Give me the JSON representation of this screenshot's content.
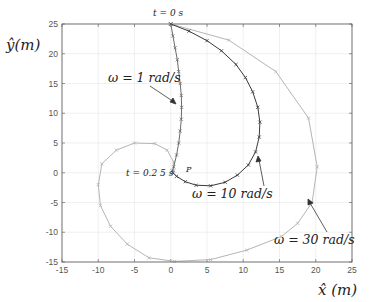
{
  "chart_data": {
    "type": "line",
    "title": "",
    "xlabel": "x̂ (m)",
    "ylabel": "ŷ(m)",
    "xlim": [
      -15,
      25
    ],
    "ylim": [
      -15,
      25
    ],
    "xticks": [
      -15,
      -10,
      -5,
      0,
      5,
      10,
      15,
      20,
      25
    ],
    "yticks": [
      -15,
      -10,
      -5,
      0,
      5,
      10,
      15,
      20,
      25
    ],
    "grid": true,
    "legend": null,
    "series": [
      {
        "name": "ω = 1 rad/s",
        "color": "#6b6b6b",
        "marker": "x",
        "points": [
          [
            0,
            25
          ],
          [
            0.3,
            23
          ],
          [
            0.6,
            21
          ],
          [
            0.9,
            19
          ],
          [
            1.1,
            17
          ],
          [
            1.3,
            15
          ],
          [
            1.45,
            13
          ],
          [
            1.5,
            11
          ],
          [
            1.45,
            9
          ],
          [
            1.3,
            7
          ],
          [
            1.1,
            5
          ],
          [
            0.8,
            3
          ],
          [
            0.4,
            1
          ],
          [
            0.2,
            0.3
          ]
        ]
      },
      {
        "name": "ω = 10 rad/s",
        "color": "#3a3a3a",
        "marker": "x",
        "points": [
          [
            0,
            25
          ],
          [
            2.5,
            23.8
          ],
          [
            5,
            22.2
          ],
          [
            7,
            20.5
          ],
          [
            9,
            18.2
          ],
          [
            10.3,
            16
          ],
          [
            11.3,
            13.6
          ],
          [
            12,
            11
          ],
          [
            12.3,
            8.5
          ],
          [
            12.2,
            6
          ],
          [
            11.7,
            3.5
          ],
          [
            10.7,
            1.3
          ],
          [
            9.2,
            -0.4
          ],
          [
            7.5,
            -1.6
          ],
          [
            5.5,
            -2.2
          ],
          [
            3.5,
            -2.1
          ],
          [
            2,
            -1.5
          ],
          [
            0.8,
            -0.6
          ],
          [
            0.3,
            0
          ]
        ]
      },
      {
        "name": "ω = 30 rad/s",
        "color": "#b5b5b5",
        "marker": "x",
        "points": [
          [
            0,
            25
          ],
          [
            8,
            22.3
          ],
          [
            14.5,
            17
          ],
          [
            19,
            9.2
          ],
          [
            20.2,
            1
          ],
          [
            19.5,
            -5
          ],
          [
            17.5,
            -8.5
          ],
          [
            15.3,
            -10.7
          ],
          [
            10.5,
            -13
          ],
          [
            5.5,
            -14.6
          ],
          [
            0.5,
            -14.9
          ],
          [
            -3,
            -14.3
          ],
          [
            -6,
            -12
          ],
          [
            -8.3,
            -9
          ],
          [
            -9.7,
            -5.5
          ],
          [
            -10,
            -2
          ],
          [
            -9.5,
            1.5
          ],
          [
            -7.5,
            3.8
          ],
          [
            -5,
            5
          ],
          [
            -2.2,
            4.9
          ],
          [
            -0.5,
            3.8
          ],
          [
            0.4,
            1.8
          ],
          [
            0.4,
            0.3
          ]
        ]
      }
    ],
    "annotations": [
      {
        "text": "t = 0 s",
        "x": 0,
        "y": 25
      },
      {
        "text": "t = 0.2 5 s",
        "x": 0,
        "y": 0
      },
      {
        "text": "P",
        "x": 2.3,
        "y": 0.5
      },
      {
        "text": "ω = 1 rad/s",
        "arrow_to": [
          1.3,
          12.5
        ]
      },
      {
        "text": "ω = 10 rad/s",
        "arrow_to": [
          12,
          4
        ]
      },
      {
        "text": "ω = 30 rad/s",
        "arrow_to": [
          18.7,
          -4.3
        ]
      }
    ]
  },
  "labels": {
    "ylabel": "ŷ(m)",
    "xlabel": "x̂ (m)",
    "t0": "t = 0 s",
    "t025": "t = 0.2 5 s",
    "p": "P",
    "w1": "ω = 1 rad/s",
    "w10": "ω = 10 rad/s",
    "w30": "ω = 30 rad/s"
  }
}
